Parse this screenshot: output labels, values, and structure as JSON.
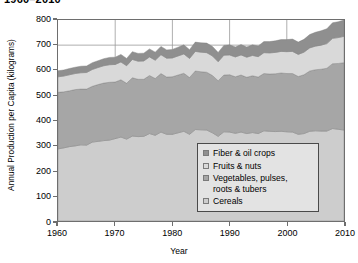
{
  "title": "1960–2010",
  "axes": {
    "ylabel": "Annual Production per Capita (kilograms)",
    "xlabel": "Year",
    "yticks": [
      "0",
      "100",
      "200",
      "300",
      "400",
      "500",
      "600",
      "700",
      "800"
    ],
    "xticks": [
      "1960",
      "1970",
      "1980",
      "1990",
      "2000",
      "2010"
    ]
  },
  "legend": {
    "items": [
      {
        "label": "Fiber & oil crops",
        "color": "#8f8f8f"
      },
      {
        "label": "Fruits & nuts",
        "color": "#d9d9d9"
      },
      {
        "label": "Vegetables, pulses,\nroots & tubers",
        "color": "#a6a6a6"
      },
      {
        "label": "Cereals",
        "color": "#cdcdcd"
      }
    ]
  },
  "chart_data": {
    "type": "area",
    "stacked": true,
    "title": "1960–2010",
    "xlabel": "Year",
    "ylabel": "Annual Production per Capita (kilograms)",
    "xlim": [
      1960,
      2010
    ],
    "ylim": [
      0,
      800
    ],
    "grid": "vertical-decades-plus-700-gridline",
    "legend_position": "inside-lower-right",
    "x": [
      1960,
      1961,
      1962,
      1963,
      1964,
      1965,
      1966,
      1967,
      1968,
      1969,
      1970,
      1971,
      1972,
      1973,
      1974,
      1975,
      1976,
      1977,
      1978,
      1979,
      1980,
      1981,
      1982,
      1983,
      1984,
      1985,
      1986,
      1987,
      1988,
      1989,
      1990,
      1991,
      1992,
      1993,
      1994,
      1995,
      1996,
      1997,
      1998,
      1999,
      2000,
      2001,
      2002,
      2003,
      2004,
      2005,
      2006,
      2007,
      2008,
      2009,
      2010
    ],
    "series": [
      {
        "name": "Cereals",
        "color": "#cdcdcd",
        "values": [
          287,
          291,
          296,
          299,
          303,
          302,
          314,
          317,
          320,
          322,
          328,
          334,
          326,
          338,
          336,
          337,
          348,
          341,
          354,
          345,
          345,
          351,
          357,
          345,
          364,
          363,
          362,
          351,
          337,
          355,
          354,
          349,
          354,
          348,
          352,
          348,
          359,
          357,
          356,
          357,
          355,
          354,
          345,
          348,
          357,
          359,
          358,
          358,
          368,
          365,
          362
        ]
      },
      {
        "name": "Vegetables, pulses, roots & tubers",
        "color": "#a6a6a6",
        "values": [
          225,
          223,
          222,
          224,
          222,
          223,
          222,
          226,
          229,
          230,
          225,
          228,
          222,
          232,
          228,
          227,
          231,
          226,
          233,
          228,
          229,
          230,
          231,
          226,
          233,
          231,
          230,
          228,
          221,
          226,
          228,
          225,
          227,
          224,
          226,
          225,
          228,
          228,
          230,
          232,
          232,
          233,
          230,
          234,
          240,
          243,
          246,
          250,
          258,
          262,
          268
        ]
      },
      {
        "name": "Fruits & nuts",
        "color": "#d9d9d9",
        "values": [
          62,
          63,
          64,
          64,
          65,
          66,
          67,
          68,
          69,
          70,
          70,
          71,
          70,
          73,
          72,
          73,
          74,
          73,
          75,
          75,
          75,
          76,
          77,
          76,
          78,
          78,
          78,
          78,
          76,
          79,
          79,
          79,
          80,
          80,
          81,
          81,
          83,
          84,
          85,
          86,
          87,
          88,
          88,
          90,
          92,
          94,
          96,
          98,
          101,
          103,
          105
        ]
      },
      {
        "name": "Fiber & oil crops",
        "color": "#8f8f8f",
        "values": [
          24,
          24,
          25,
          25,
          26,
          26,
          27,
          27,
          28,
          29,
          29,
          30,
          29,
          31,
          31,
          31,
          32,
          32,
          33,
          33,
          34,
          35,
          36,
          35,
          37,
          37,
          38,
          38,
          37,
          39,
          40,
          40,
          41,
          41,
          42,
          43,
          44,
          45,
          46,
          47,
          48,
          49,
          49,
          51,
          53,
          55,
          57,
          59,
          62,
          63,
          65
        ]
      }
    ]
  }
}
